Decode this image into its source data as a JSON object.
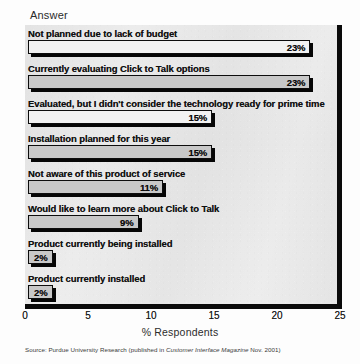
{
  "chart_data": {
    "type": "bar",
    "orientation": "horizontal",
    "title": "Answer",
    "xlabel": "% Respondents",
    "ylabel": "",
    "xlim": [
      0,
      25
    ],
    "xticks": [
      0,
      5,
      10,
      15,
      20,
      25
    ],
    "grid": false,
    "legend": null,
    "categories": [
      "Not planned due to lack of budget",
      "Currently evaluating Click to Talk options",
      "Evaluated, but I didn't consider the technology ready for prime time",
      "Installation planned for this year",
      "Not aware of this product of service",
      "Would like to learn more about Click to Talk",
      "Product currently being installed",
      "Product currently installed"
    ],
    "values": [
      23,
      23,
      15,
      15,
      11,
      9,
      2,
      2
    ],
    "data_labels": [
      "23%",
      "23%",
      "15%",
      "15%",
      "11%",
      "9%",
      "2%",
      "2%"
    ],
    "bar_fills": [
      "light",
      "gray",
      "light",
      "gray",
      "gray",
      "gray",
      "gray",
      "gray"
    ]
  },
  "source": {
    "prefix": "Source: Purdue University Research (published in ",
    "italic": "Customer Interface Magazine",
    "suffix": " Nov. 2001)"
  },
  "colors": {
    "bar_gray": "#c8c8c8",
    "bar_light": "#f2f2f2",
    "bar_border": "#0d0d0d",
    "axis": "#0a0a0a",
    "plot_background": "#ececec",
    "text": "#101010"
  }
}
